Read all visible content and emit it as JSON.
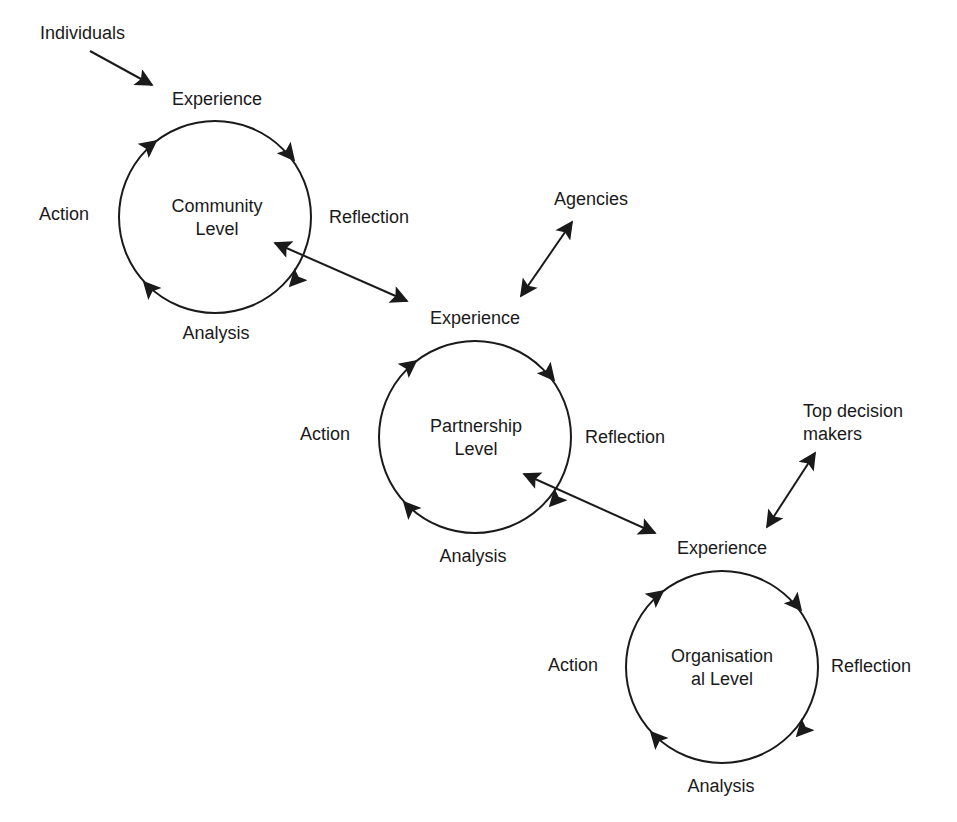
{
  "diagram": {
    "type": "cycle-flow",
    "stroke_color": "#1a1a1a",
    "background": "#ffffff",
    "external_actors": [
      {
        "id": "individuals",
        "label": "Individuals"
      },
      {
        "id": "agencies",
        "label": "Agencies"
      },
      {
        "id": "top_decision_makers",
        "label": "Top decision\nmakers",
        "line1": "Top decision",
        "line2": "makers"
      }
    ],
    "cycles": [
      {
        "id": "community",
        "center_label_line1": "Community",
        "center_label_line2": "Level",
        "stages": {
          "top": "Experience",
          "right": "Reflection",
          "bottom": "Analysis",
          "left": "Action"
        },
        "direction": "clockwise"
      },
      {
        "id": "partnership",
        "center_label_line1": "Partnership",
        "center_label_line2": "Level",
        "stages": {
          "top": "Experience",
          "right": "Reflection",
          "bottom": "Analysis",
          "left": "Action"
        },
        "direction": "clockwise"
      },
      {
        "id": "organisational",
        "center_label_line1": "Organisation",
        "center_label_line2": "al Level",
        "stages": {
          "top": "Experience",
          "right": "Reflection",
          "bottom": "Analysis",
          "left": "Action"
        },
        "direction": "clockwise"
      }
    ],
    "edges": [
      {
        "from": "individuals",
        "to": "community.experience",
        "type": "one-way"
      },
      {
        "from": "community",
        "to": "partnership.experience",
        "type": "two-way"
      },
      {
        "from": "agencies",
        "to": "partnership.experience",
        "type": "two-way"
      },
      {
        "from": "partnership",
        "to": "organisational.experience",
        "type": "two-way"
      },
      {
        "from": "top_decision_makers",
        "to": "organisational.experience",
        "type": "two-way"
      }
    ]
  }
}
